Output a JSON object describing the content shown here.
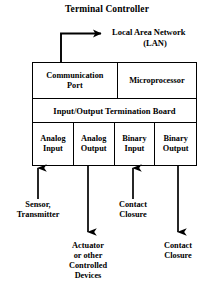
{
  "diagram": {
    "title": "Terminal Controller",
    "network": {
      "label_line1": "Local Area Network",
      "label_line2": "(LAN)",
      "arrow_icon": "arrow-right-icon"
    },
    "controller": {
      "row_top": [
        {
          "id": "communication-port",
          "label": "Communication\nPort",
          "line1": "Communication",
          "line2": "Port"
        },
        {
          "id": "microprocessor",
          "label": "Microprocessor"
        }
      ],
      "row_mid": [
        {
          "id": "io-termination-board",
          "label": "Input/Output Termination Board"
        }
      ],
      "row_bottom": [
        {
          "id": "analog-input",
          "line1": "Analog",
          "line2": "Input"
        },
        {
          "id": "analog-output",
          "line1": "Analog",
          "line2": "Output"
        },
        {
          "id": "binary-input",
          "line1": "Binary",
          "line2": "Input"
        },
        {
          "id": "binary-output",
          "line1": "Binary",
          "line2": "Output"
        }
      ]
    },
    "io_connections": [
      {
        "id": "sensor-transmitter",
        "port": "analog-input",
        "direction": "up-into-controller",
        "arrow_icon": "arrow-up-icon",
        "line1": "Sensor,",
        "line2": "Transmitter"
      },
      {
        "id": "actuator-controlled-devices",
        "port": "analog-output",
        "direction": "down-out-of-controller",
        "arrow_icon": "arrow-down-icon",
        "line1": "Actuator",
        "line2": "or other",
        "line3": "Controlled",
        "line4": "Devices"
      },
      {
        "id": "contact-closure-input",
        "port": "binary-input",
        "direction": "up-into-controller",
        "arrow_icon": "arrow-up-icon",
        "line1": "Contact",
        "line2": "Closure"
      },
      {
        "id": "contact-closure-output",
        "port": "binary-output",
        "direction": "down-out-of-controller",
        "arrow_icon": "arrow-down-icon",
        "line1": "Contact",
        "line2": "Closure"
      }
    ],
    "colors": {
      "ink": "#000000",
      "background": "#ffffff"
    }
  }
}
